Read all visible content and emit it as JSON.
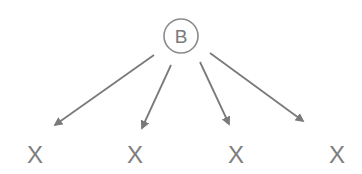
{
  "diagram": {
    "type": "tree",
    "root": {
      "label": "B",
      "shape": "circle",
      "cx": 181,
      "cy": 36,
      "r": 17
    },
    "children": [
      {
        "label": "X",
        "x": 35
      },
      {
        "label": "X",
        "x": 135
      },
      {
        "label": "X",
        "x": 236
      },
      {
        "label": "X",
        "x": 337
      }
    ],
    "edges": [
      {
        "from": "B",
        "to": 0,
        "x1": 154,
        "y1": 55,
        "x2": 55,
        "y2": 125
      },
      {
        "from": "B",
        "to": 1,
        "x1": 171,
        "y1": 65,
        "x2": 142,
        "y2": 128
      },
      {
        "from": "B",
        "to": 2,
        "x1": 200,
        "y1": 62,
        "x2": 229,
        "y2": 124
      },
      {
        "from": "B",
        "to": 3,
        "x1": 210,
        "y1": 53,
        "x2": 303,
        "y2": 121
      }
    ],
    "colors": {
      "stroke": "#7a7a7a",
      "text": "#7a7a7a",
      "background": "#ffffff"
    }
  }
}
